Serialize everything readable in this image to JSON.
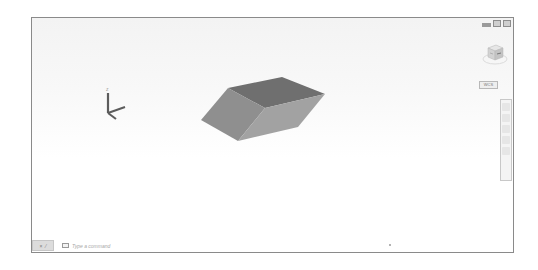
{
  "viewport": {
    "window_controls": [
      "minimize",
      "restore",
      "close"
    ],
    "viewcube": {
      "faces": {
        "top": "TOP",
        "front": "FRONT",
        "right": "RIGHT"
      },
      "compass": [
        "N",
        "S",
        "E",
        "W"
      ]
    },
    "wcs_label": "WCS",
    "navigation_bar": {
      "tools": [
        "steering-wheel",
        "pan",
        "zoom",
        "orbit",
        "showmotion"
      ]
    },
    "model": {
      "type": "3d-solid",
      "face_colors": {
        "top": "#6f6f6f",
        "left": "#8f8f8f",
        "right": "#a2a2a2"
      }
    },
    "ucs_icon": {
      "axes": [
        "X",
        "Y",
        "Z"
      ]
    }
  },
  "command_line": {
    "placeholder": "Type a command",
    "close_symbol": "×",
    "customize_symbol": "⁄"
  },
  "colors": {
    "viewport_border": "#8a8a8a",
    "background": "#ffffff"
  }
}
